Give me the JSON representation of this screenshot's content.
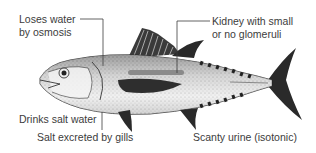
{
  "diagram": {
    "labels": {
      "loses_water_1": "Loses water",
      "loses_water_2": "by osmosis",
      "kidney_1": "Kidney with small",
      "kidney_2": "or no glomeruli",
      "drinks": "Drinks salt water",
      "salt": "Salt excreted by gills",
      "urine": "Scanty urine (isotonic)"
    },
    "colors": {
      "body_fill": "#e9e9e9",
      "fin_fill": "#2a2a2a",
      "kidney_fill": "#8a8a8a",
      "leader_line": "#3c3c3c",
      "text": "#3c3c3c"
    }
  }
}
